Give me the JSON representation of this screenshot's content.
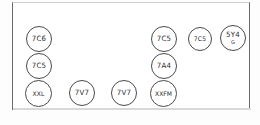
{
  "diagram": {
    "style": "hand-drawn sketch",
    "frame": {
      "name": "chassis-outline",
      "shape": "rectangle",
      "stroke_color": "#4a4a4a",
      "fill_color": "#ffffff"
    },
    "nodes": [
      {
        "id": "n1",
        "label": "7C6",
        "sublabel": "",
        "x": 26,
        "y": 26,
        "size": 26,
        "col": 1,
        "row": 1
      },
      {
        "id": "n2",
        "label": "7C5",
        "sublabel": "",
        "x": 26,
        "y": 53,
        "size": 26,
        "col": 1,
        "row": 2
      },
      {
        "id": "n3",
        "label": "XXL",
        "sublabel": "",
        "x": 25,
        "y": 80,
        "size": 27,
        "col": 1,
        "row": 3
      },
      {
        "id": "n4",
        "label": "7V7",
        "sublabel": "",
        "x": 69,
        "y": 80,
        "size": 26,
        "col": 2,
        "row": 3
      },
      {
        "id": "n5",
        "label": "7V7",
        "sublabel": "",
        "x": 111,
        "y": 80,
        "size": 26,
        "col": 3,
        "row": 3
      },
      {
        "id": "n6",
        "label": "XXFM",
        "sublabel": "",
        "x": 150,
        "y": 80,
        "size": 27,
        "col": 4,
        "row": 3
      },
      {
        "id": "n7",
        "label": "7A4",
        "sublabel": "",
        "x": 151,
        "y": 53,
        "size": 26,
        "col": 4,
        "row": 2
      },
      {
        "id": "n8",
        "label": "7C5",
        "sublabel": "",
        "x": 151,
        "y": 26,
        "size": 26,
        "col": 4,
        "row": 1
      },
      {
        "id": "n9",
        "label": "7C5",
        "sublabel": "",
        "x": 188,
        "y": 27,
        "size": 24,
        "col": 5,
        "row": 1
      },
      {
        "id": "n10",
        "label": "5Y4",
        "sublabel": "G",
        "x": 220,
        "y": 25,
        "size": 26,
        "col": 6,
        "row": 1
      }
    ]
  }
}
